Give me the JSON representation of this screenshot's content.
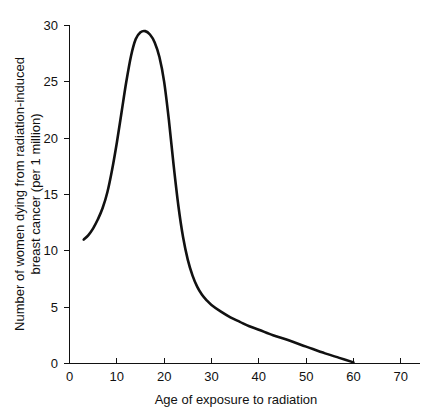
{
  "chart_data": {
    "type": "line",
    "title": "",
    "subtitle": "",
    "xlabel": "Age of exposure to radiation",
    "ylabel": "Number of women dying from radiation-induced breast cancer (per 1 million)",
    "ylabel_line1": "Number of women dying from radiation-induced",
    "ylabel_line2": "breast cancer (per 1 million)",
    "xlim": [
      0,
      75
    ],
    "ylim": [
      0,
      30
    ],
    "xticks": [
      0,
      10,
      20,
      30,
      40,
      50,
      60,
      70
    ],
    "yticks": [
      0,
      5,
      10,
      15,
      20,
      25,
      30
    ],
    "xtick_labels": [
      "0",
      "10",
      "20",
      "30",
      "40",
      "50",
      "60",
      "70"
    ],
    "ytick_labels": [
      "0",
      "5",
      "10",
      "15",
      "20",
      "25",
      "30"
    ],
    "grid": false,
    "legend": false,
    "legend_position": "none",
    "series": [
      {
        "name": "Radiation-induced breast cancer deaths",
        "color": "#111111",
        "x": [
          3,
          4,
          5,
          6,
          7,
          8,
          9,
          10,
          11,
          12,
          13,
          14,
          15,
          16,
          17,
          18,
          19,
          20,
          21,
          22,
          23,
          24,
          25,
          26,
          27,
          28,
          29,
          30,
          32,
          34,
          36,
          38,
          40,
          43,
          46,
          50,
          54,
          57,
          60
        ],
        "y": [
          11.0,
          11.4,
          12.0,
          12.8,
          13.8,
          15.2,
          17.2,
          19.6,
          22.3,
          25.0,
          27.3,
          28.8,
          29.4,
          29.5,
          29.2,
          28.5,
          27.2,
          25.0,
          21.6,
          17.6,
          14.0,
          11.2,
          9.2,
          7.8,
          6.8,
          6.1,
          5.6,
          5.2,
          4.6,
          4.1,
          3.7,
          3.3,
          3.0,
          2.5,
          2.1,
          1.5,
          0.9,
          0.5,
          0.1
        ]
      }
    ],
    "annotations": []
  },
  "axis": {
    "x_axis_name": "x-axis",
    "y_axis_name": "y-axis"
  }
}
